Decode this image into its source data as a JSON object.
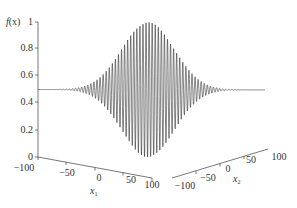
{
  "chart_data": {
    "type": "line",
    "subtype": "3d-projection",
    "title": "",
    "ylabel": "f(x)",
    "x1label": "x1",
    "x2label": "x2",
    "zlim": [
      0,
      1
    ],
    "z_ticks": [
      "0",
      "0.2",
      "0.4",
      "0.6",
      "0.8",
      "1"
    ],
    "x1_ticks": [
      "-100",
      "-50",
      "0",
      "50",
      "100"
    ],
    "x2_ticks": [
      "-100",
      "-50",
      "0",
      "50",
      "100"
    ],
    "x1_range": [
      -100,
      100
    ],
    "x2_range": [
      -100,
      100
    ],
    "baseline": 0.5,
    "peak_max": 1.0,
    "peak_min": 0.0,
    "envelope_center_x1": 50,
    "grid": false,
    "legend": null,
    "line_color": "#222222"
  },
  "labels": {
    "y_title_f": "f",
    "y_title_rest": "(x)",
    "x1_var": "x",
    "x1_sub": "1",
    "x2_var": "x",
    "x2_sub": "2",
    "z0": "0",
    "z02": "0.2",
    "z04": "0.4",
    "z06": "0.6",
    "z08": "0.8",
    "z1": "1",
    "a_m100": "−100",
    "a_m50": "−50",
    "a_0": "0",
    "a_50": "50",
    "a_100": "100",
    "b_m100": "−100",
    "b_m50": "−50",
    "b_0": "0",
    "b_50": "50",
    "b_100": "100"
  }
}
